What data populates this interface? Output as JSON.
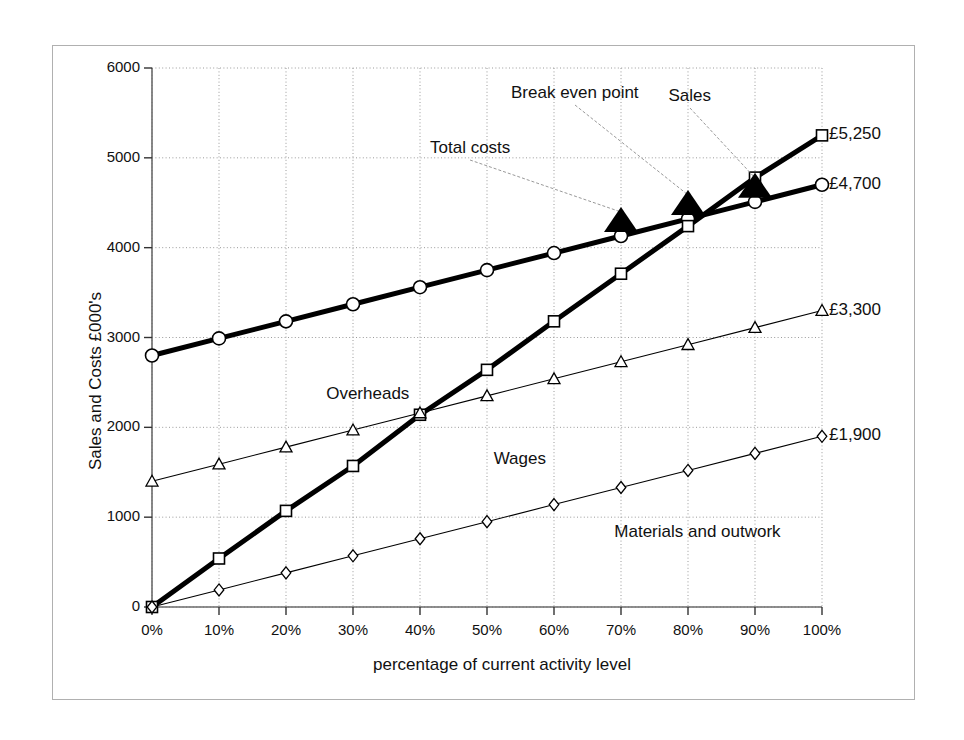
{
  "chart_data": {
    "type": "line",
    "title": "",
    "xlabel": "percentage of current activity level",
    "ylabel": "Sales and Costs £000's",
    "categories": [
      "0%",
      "10%",
      "20%",
      "30%",
      "40%",
      "50%",
      "60%",
      "70%",
      "80%",
      "90%",
      "100%"
    ],
    "x": [
      0,
      10,
      20,
      30,
      40,
      50,
      60,
      70,
      80,
      90,
      100
    ],
    "xlim": [
      0,
      100
    ],
    "ylim": [
      0,
      6000
    ],
    "yticks": [
      0,
      1000,
      2000,
      3000,
      4000,
      5000,
      6000
    ],
    "ytick_labels": [
      "0",
      "1000",
      "2000",
      "3000",
      "4000",
      "5000",
      "6000"
    ],
    "grid": true,
    "legend": "none (series labelled inline on plot)",
    "series": [
      {
        "name": "Sales",
        "marker": "circle",
        "line": "thick",
        "end_label": "£4,700",
        "values": [
          2800,
          2990,
          3180,
          3370,
          3560,
          3750,
          3940,
          4130,
          4320,
          4510,
          4700
        ]
      },
      {
        "name": "Total costs",
        "marker": "square",
        "line": "thick",
        "end_label": "£5,250",
        "values": [
          0,
          540,
          1070,
          1570,
          2140,
          2640,
          3180,
          3710,
          4240,
          4780,
          5250
        ]
      },
      {
        "name": "Overheads",
        "marker": "triangle",
        "line": "thin",
        "end_label": "£3,300",
        "values": [
          1400,
          1590,
          1780,
          1970,
          2160,
          2350,
          2540,
          2730,
          2920,
          3110,
          3300
        ]
      },
      {
        "name": "Materials and outwork",
        "marker": "diamond",
        "line": "thin",
        "end_label": "£1,900",
        "values": [
          0,
          190,
          380,
          570,
          760,
          950,
          1140,
          1330,
          1520,
          1710,
          1900
        ]
      }
    ],
    "inline_labels": [
      {
        "text": "Overheads",
        "x": 26,
        "y": 2480
      },
      {
        "text": "Wages",
        "x": 51,
        "y": 1760
      },
      {
        "text": "Materials and outwork",
        "x": 69,
        "y": 950
      }
    ],
    "annotations": [
      {
        "text": "Break even point",
        "arrow_to_x": 80,
        "arrow_to_y": 4350
      },
      {
        "text": "Sales",
        "arrow_to_x": 90,
        "arrow_to_y": 4870
      },
      {
        "text": "Total costs",
        "arrow_to_x": 70,
        "arrow_to_y": 4100
      }
    ]
  },
  "axis": {
    "y_title": "Sales and Costs £000's",
    "x_title": "percentage of current activity level"
  },
  "end_labels": {
    "sales": "£4,700",
    "total_costs": "£5,250",
    "overheads": "£3,300",
    "materials": "£1,900"
  },
  "annotations": {
    "break_even": "Break even point",
    "sales": "Sales",
    "total_costs": "Total costs"
  },
  "inline": {
    "overheads": "Overheads",
    "wages": "Wages",
    "materials": "Materials and outwork"
  },
  "colors": {
    "line": "#000000",
    "grid": "#9a9a9a",
    "axis": "#6b6b6b",
    "frame": "#b0b0b0",
    "text": "#111111"
  }
}
